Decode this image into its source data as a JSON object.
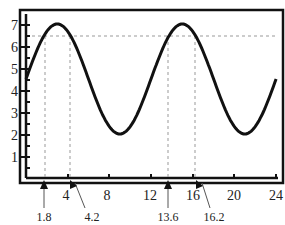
{
  "chart_data": {
    "type": "line",
    "title": "",
    "xlabel": "",
    "ylabel": "",
    "xlim": [
      0,
      24
    ],
    "ylim": [
      0,
      7.5
    ],
    "x_ticks": [
      4,
      8,
      12,
      16,
      20,
      24
    ],
    "y_ticks": [
      1,
      2,
      3,
      4,
      5,
      6,
      7
    ],
    "x_tick_labels": [
      "4",
      "8",
      "12",
      "16",
      "20",
      "24"
    ],
    "y_tick_labels": [
      "1",
      "2",
      "3",
      "4",
      "5",
      "6",
      "7"
    ],
    "grid": false,
    "series": [
      {
        "name": "curve",
        "x": [
          0,
          1,
          2,
          3,
          4,
          5,
          6,
          7,
          8,
          9,
          10,
          11,
          12,
          13,
          14,
          15,
          16,
          17,
          18,
          19,
          20,
          21,
          22,
          23,
          24
        ],
        "values": [
          4.5,
          5.75,
          6.67,
          7.0,
          6.67,
          5.75,
          4.5,
          3.25,
          2.33,
          2.0,
          2.33,
          3.25,
          4.5,
          5.75,
          6.67,
          7.0,
          6.67,
          5.75,
          4.5,
          3.25,
          2.33,
          2.0,
          2.33,
          3.25,
          4.5
        ]
      }
    ],
    "reference_lines": {
      "horizontal": [
        6.5
      ],
      "vertical": [
        1.8,
        4.2,
        13.6,
        16.2
      ]
    },
    "annotations": [
      "1.8",
      "4.2",
      "13.6",
      "16.2"
    ]
  },
  "annotations": {
    "a1": "1.8",
    "a2": "4.2",
    "a3": "13.6",
    "a4": "16.2"
  },
  "ticks": {
    "x": [
      "4",
      "8",
      "12",
      "16",
      "20",
      "24"
    ],
    "y": [
      "1",
      "2",
      "3",
      "4",
      "5",
      "6",
      "7"
    ]
  }
}
